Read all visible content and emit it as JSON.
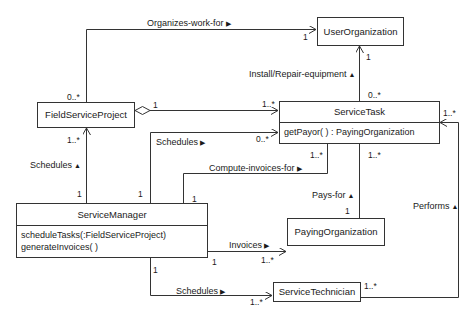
{
  "classes": {
    "user_org": {
      "name": "UserOrganization"
    },
    "field_project": {
      "name": "FieldServiceProject"
    },
    "service_task": {
      "name": "ServiceTask",
      "operations": [
        "getPayor( ) : PayingOrganization"
      ]
    },
    "service_manager": {
      "name": "ServiceManager",
      "operations": [
        "scheduleTasks(:FieldServiceProject)",
        "generateInvoices( )"
      ]
    },
    "paying_org": {
      "name": "PayingOrganization"
    },
    "technician": {
      "name": "ServiceTechnician"
    }
  },
  "associations": {
    "organizes": {
      "label": "Organizes-work-for",
      "direction": "right",
      "mult_from": "0..*",
      "mult_to": "1"
    },
    "install": {
      "label": "Install/Repair-equipment",
      "direction": "up",
      "mult_from": "0..*",
      "mult_to": "1"
    },
    "aggregation": {
      "mult_from": "1",
      "mult_to": "1..*"
    },
    "schedules_project": {
      "label": "Schedules",
      "direction": "up",
      "mult_from": "1",
      "mult_to": "1..*"
    },
    "schedules_task": {
      "label": "Schedules",
      "direction": "right",
      "mult_from": "1",
      "mult_to": "0..*"
    },
    "compute_invoices": {
      "label": "Compute-invoices-for",
      "direction": "right",
      "mult_from": "1",
      "mult_to": "1..*"
    },
    "pays_for": {
      "label": "Pays-for",
      "direction": "up",
      "mult_from": "1",
      "mult_to": "1..*"
    },
    "invoices": {
      "label": "Invoices",
      "direction": "right",
      "mult_from": "1",
      "mult_to": "1..*"
    },
    "schedules_tech": {
      "label": "Schedules",
      "direction": "right",
      "mult_from": "1",
      "mult_to": "1..*"
    },
    "performs": {
      "label": "Performs",
      "direction": "up",
      "mult_from": "1..*",
      "mult_to": "1..*"
    }
  },
  "triangles": {
    "right": "▶",
    "up": "▲"
  }
}
